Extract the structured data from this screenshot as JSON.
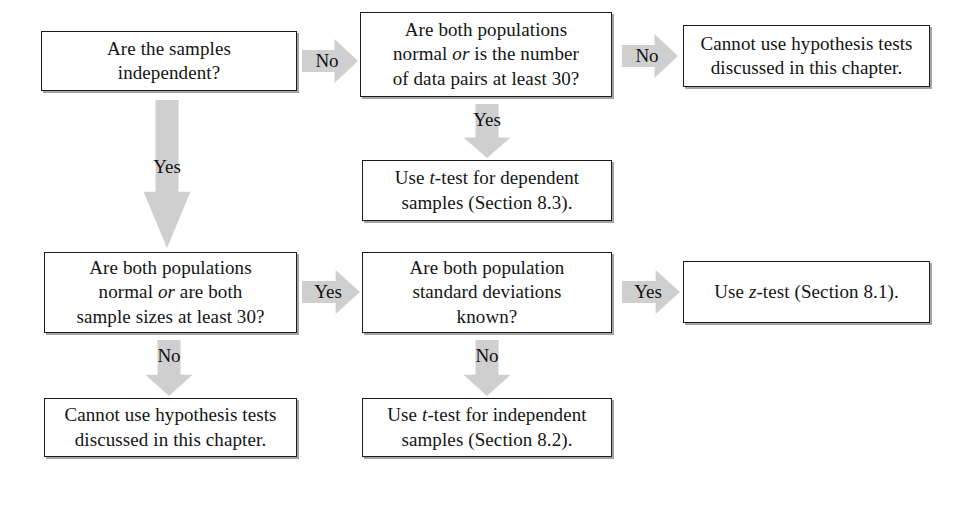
{
  "diagram": {
    "background_color": "#ffffff",
    "box_border_color": "#1a1a1a",
    "arrow_fill_color": "#cfcfcf",
    "text_color": "#141414"
  },
  "nodes": {
    "q_independent": {
      "line1": "Are the samples",
      "line2": "independent?"
    },
    "q_paired_normal": {
      "line1": "Are both populations",
      "line2_a": "normal ",
      "line2_i": "or",
      "line2_b": " is the number",
      "line3": "of data pairs at least 30?"
    },
    "r_cannot_top": {
      "line1": "Cannot use hypothesis tests",
      "line2": "discussed in this chapter."
    },
    "r_t_dependent": {
      "line1_a": "Use ",
      "line1_i": "t",
      "line1_b": "-test for dependent",
      "line2": "samples (Section 8.3)."
    },
    "q_indep_normal": {
      "line1": "Are both populations",
      "line2_a": "normal ",
      "line2_i": "or",
      "line2_b": " are both",
      "line3": "sample sizes at least 30?"
    },
    "q_sigma_known": {
      "line1": "Are both population",
      "line2": "standard deviations",
      "line3": "known?"
    },
    "r_z_test": {
      "line1_a": "Use ",
      "line1_i": "z",
      "line1_b": "-test (Section 8.1)."
    },
    "r_cannot_bottom": {
      "line1": "Cannot use hypothesis tests",
      "line2": "discussed in this chapter."
    },
    "r_t_independent": {
      "line1_a": "Use ",
      "line1_i": "t",
      "line1_b": "-test for independent",
      "line2": "samples (Section 8.2)."
    }
  },
  "arrows": {
    "independent_no": "No",
    "independent_yes": "Yes",
    "paired_normal_no": "No",
    "paired_normal_yes": "Yes",
    "indep_normal_yes": "Yes",
    "indep_normal_no": "No",
    "sigma_known_yes": "Yes",
    "sigma_known_no": "No"
  }
}
